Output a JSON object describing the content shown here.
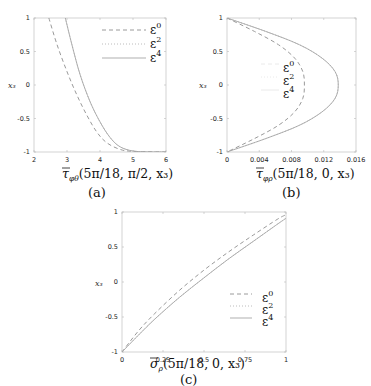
{
  "chart_data": [
    {
      "id": "a",
      "type": "line",
      "caption": "(a)",
      "xlabel": "τ̄_{φθ}(5π/18, π/2, x₃)",
      "xlabel_main": "τ",
      "xlabel_sub": "φθ",
      "xlabel_args": "(5π/18, π/2, x₃)",
      "ylabel": "x₃",
      "xlim": [
        2,
        6
      ],
      "ylim": [
        -1,
        1
      ],
      "xticks": [
        "2",
        "3",
        "4",
        "5",
        "6"
      ],
      "yticks": [
        "1",
        "0.5",
        "0",
        "-0.5",
        "-1"
      ],
      "grid": false,
      "legend_position": "upper right",
      "legend": [
        "ε0",
        "ε2",
        "ε4"
      ],
      "series": [
        {
          "name": "ε0",
          "style": "dashed",
          "x": [
            2.45,
            2.7,
            3.0,
            3.3,
            3.6,
            3.9,
            4.2,
            4.6,
            5.0,
            6.0
          ],
          "y": [
            1.0,
            0.6,
            0.2,
            -0.15,
            -0.45,
            -0.7,
            -0.86,
            -0.96,
            -0.99,
            -1.0
          ]
        },
        {
          "name": "ε2",
          "style": "dotted",
          "x": [
            2.95,
            3.15,
            3.4,
            3.7,
            4.0,
            4.3,
            4.6,
            5.0,
            5.5,
            6.0
          ],
          "y": [
            1.0,
            0.6,
            0.15,
            -0.25,
            -0.55,
            -0.78,
            -0.92,
            -0.985,
            -0.998,
            -1.0
          ]
        },
        {
          "name": "ε4",
          "style": "solid",
          "x": [
            2.95,
            3.15,
            3.4,
            3.7,
            4.0,
            4.3,
            4.6,
            5.0,
            5.5,
            6.0
          ],
          "y": [
            1.0,
            0.6,
            0.15,
            -0.25,
            -0.55,
            -0.78,
            -0.92,
            -0.985,
            -0.998,
            -1.0
          ]
        }
      ]
    },
    {
      "id": "b",
      "type": "line",
      "caption": "(b)",
      "xlabel": "τ̄_{φρ}(5π/18, 0, x₃)",
      "xlabel_main": "τ",
      "xlabel_sub": "φρ",
      "xlabel_args": "(5π/18, 0, x₃)",
      "ylabel": "x₃",
      "xlim": [
        0,
        0.016
      ],
      "ylim": [
        -1,
        1
      ],
      "xticks": [
        "0",
        "0.004",
        "0.008",
        "0.012",
        "0.016"
      ],
      "yticks": [
        "1",
        "0.5",
        "0",
        "-0.5",
        "-1"
      ],
      "grid": false,
      "legend_position": "center",
      "legend": [
        "ε0",
        "ε2",
        "ε4"
      ],
      "series": [
        {
          "name": "ε0",
          "style": "dashed",
          "x": [
            0,
            0.0034,
            0.0064,
            0.0084,
            0.0094,
            0.0096,
            0.0094,
            0.0084,
            0.0064,
            0.0034,
            0
          ],
          "y": [
            1.0,
            0.8,
            0.6,
            0.4,
            0.2,
            0.0,
            -0.2,
            -0.4,
            -0.6,
            -0.8,
            -1.0
          ]
        },
        {
          "name": "ε2",
          "style": "dotted",
          "x": [
            0,
            0.0048,
            0.009,
            0.0118,
            0.0134,
            0.0138,
            0.0134,
            0.0118,
            0.009,
            0.0048,
            0
          ],
          "y": [
            1.0,
            0.8,
            0.6,
            0.4,
            0.2,
            0.0,
            -0.2,
            -0.4,
            -0.6,
            -0.8,
            -1.0
          ]
        },
        {
          "name": "ε4",
          "style": "solid",
          "x": [
            0,
            0.0048,
            0.009,
            0.0118,
            0.0134,
            0.0138,
            0.0134,
            0.0118,
            0.009,
            0.0048,
            0
          ],
          "y": [
            1.0,
            0.8,
            0.6,
            0.4,
            0.2,
            0.0,
            -0.2,
            -0.4,
            -0.6,
            -0.8,
            -1.0
          ]
        }
      ]
    },
    {
      "id": "c",
      "type": "line",
      "caption": "(c)",
      "xlabel": "σ̄_ρ(5π/18, 0, x₃)",
      "xlabel_main": "σ",
      "xlabel_sub": "ρ",
      "xlabel_args": "(5π/18, 0, x₃)",
      "ylabel": "x₃",
      "xlim": [
        0,
        1
      ],
      "ylim": [
        -1,
        1
      ],
      "xticks": [
        "0",
        "0.25",
        "0.5",
        "0.75",
        "1"
      ],
      "yticks": [
        "1",
        "0.5",
        "0",
        "-0.5",
        "-1"
      ],
      "grid": false,
      "legend_position": "lower right",
      "legend": [
        "ε0",
        "ε2",
        "ε4"
      ],
      "series": [
        {
          "name": "ε0",
          "style": "dashed",
          "x": [
            0,
            0.1,
            0.2,
            0.35,
            0.5,
            0.65,
            0.8,
            0.95,
            1.0
          ],
          "y": [
            -1.0,
            -0.7,
            -0.45,
            -0.12,
            0.17,
            0.43,
            0.67,
            0.9,
            0.96
          ]
        },
        {
          "name": "ε2",
          "style": "dotted",
          "x": [
            0,
            0.1,
            0.2,
            0.35,
            0.5,
            0.65,
            0.8,
            0.95,
            1.0
          ],
          "y": [
            -1.0,
            -0.76,
            -0.53,
            -0.22,
            0.06,
            0.33,
            0.58,
            0.83,
            0.91
          ]
        },
        {
          "name": "ε4",
          "style": "solid",
          "x": [
            0,
            0.1,
            0.2,
            0.35,
            0.5,
            0.65,
            0.8,
            0.95,
            1.0
          ],
          "y": [
            -1.0,
            -0.76,
            -0.53,
            -0.22,
            0.06,
            0.33,
            0.58,
            0.83,
            0.91
          ]
        }
      ]
    }
  ],
  "legend_labels": {
    "base": "ε",
    "sups": [
      "0",
      "2",
      "4"
    ]
  }
}
